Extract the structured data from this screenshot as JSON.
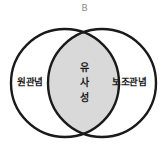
{
  "diagram": {
    "type": "venn",
    "top_label": "B",
    "left_set": {
      "label": "원관념",
      "center": [
        65,
        83
      ],
      "radius": 54
    },
    "right_set": {
      "label": "보조관념",
      "center": [
        102,
        83
      ],
      "radius": 54
    },
    "intersection": {
      "label": "유사성",
      "chars": [
        "유",
        "사",
        "성"
      ],
      "fill": "#d9d9d9"
    },
    "stroke_color": "#1a1a1a",
    "background": "#ffffff"
  }
}
